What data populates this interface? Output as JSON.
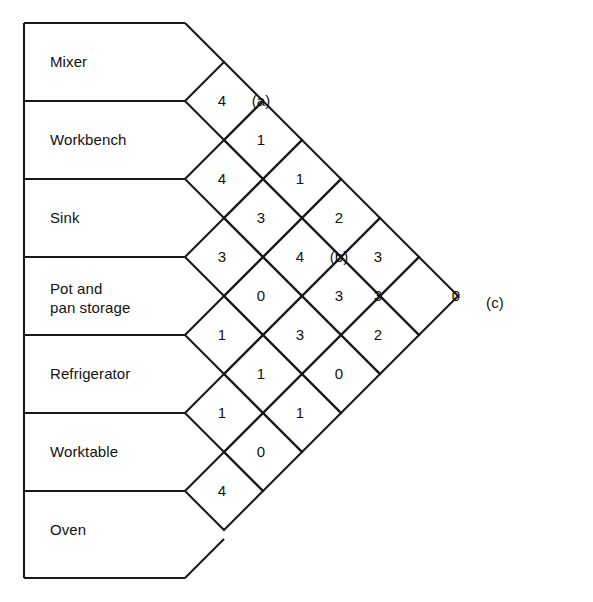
{
  "figure": {
    "kind": "activity-relationship-chart",
    "title": "",
    "stroke_color": "#1a1a1a",
    "text_color": "#121212",
    "background": "#ffffff"
  },
  "activities": [
    {
      "index": 1,
      "label": "Mixer"
    },
    {
      "index": 2,
      "label": "Workbench"
    },
    {
      "index": 3,
      "label": "Sink"
    },
    {
      "index": 4,
      "label": "Pot and\npan storage"
    },
    {
      "index": 5,
      "label": "Refrigerator"
    },
    {
      "index": 6,
      "label": "Worktable"
    },
    {
      "index": 7,
      "label": "Oven"
    }
  ],
  "chart_data": {
    "type": "table",
    "xlabel": "",
    "ylabel": "",
    "note": "Triangular REL chart: each diamond holds the closeness/flow rating between the pair of activities whose rows meet at that diamond. Letters (a), (b), (c) mark callout cells.",
    "row_labels": [
      "Mixer",
      "Workbench",
      "Sink",
      "Pot and pan storage",
      "Refrigerator",
      "Worktable",
      "Oven"
    ],
    "diagonals": [
      {
        "offset": 1,
        "pairs": [
          [
            "Mixer",
            "Workbench"
          ],
          [
            "Workbench",
            "Sink"
          ],
          [
            "Sink",
            "Pot and pan storage"
          ],
          [
            "Pot and pan storage",
            "Refrigerator"
          ],
          [
            "Refrigerator",
            "Worktable"
          ],
          [
            "Worktable",
            "Oven"
          ]
        ],
        "values": [
          "4",
          "4",
          "3",
          "1",
          "1",
          "4"
        ]
      },
      {
        "offset": 2,
        "pairs": [
          [
            "Mixer",
            "Sink"
          ],
          [
            "Workbench",
            "Pot and pan storage"
          ],
          [
            "Sink",
            "Refrigerator"
          ],
          [
            "Pot and pan storage",
            "Worktable"
          ],
          [
            "Refrigerator",
            "Oven"
          ]
        ],
        "values": [
          "(a)",
          "1",
          "3",
          "0",
          "1",
          "0"
        ]
      },
      {
        "offset": 3,
        "pairs": [
          [
            "Mixer",
            "Pot and pan storage"
          ],
          [
            "Workbench",
            "Refrigerator"
          ],
          [
            "Sink",
            "Worktable"
          ],
          [
            "Pot and pan storage",
            "Oven"
          ]
        ],
        "values": [
          "1",
          "4",
          "3",
          "1"
        ]
      },
      {
        "offset": 4,
        "pairs": [
          [
            "Mixer",
            "Refrigerator"
          ],
          [
            "Workbench",
            "Worktable"
          ],
          [
            "Sink",
            "Oven"
          ]
        ],
        "values": [
          "2",
          "(b)",
          "3",
          "0"
        ]
      },
      {
        "offset": 5,
        "pairs": [
          [
            "Mixer",
            "Worktable"
          ],
          [
            "Workbench",
            "Oven"
          ]
        ],
        "values": [
          "3",
          "3",
          "2"
        ]
      },
      {
        "offset": 6,
        "pairs": [
          [
            "Mixer",
            "Oven"
          ]
        ],
        "values": [
          "0",
          "(c)"
        ]
      }
    ],
    "cells": [
      {
        "col": 1,
        "row": 1,
        "cx": 222,
        "cy": 100,
        "value": "4"
      },
      {
        "col": 1,
        "row": 2,
        "cx": 222,
        "cy": 178,
        "value": "4"
      },
      {
        "col": 1,
        "row": 3,
        "cx": 222,
        "cy": 256,
        "value": "3"
      },
      {
        "col": 1,
        "row": 4,
        "cx": 222,
        "cy": 334,
        "value": "1"
      },
      {
        "col": 1,
        "row": 5,
        "cx": 222,
        "cy": 412,
        "value": "1"
      },
      {
        "col": 1,
        "row": 6,
        "cx": 222,
        "cy": 490,
        "value": "4"
      },
      {
        "col": 2,
        "row": 1,
        "cx": 261,
        "cy": 100,
        "value": "(a)"
      },
      {
        "col": 2,
        "row": 2,
        "cx": 261,
        "cy": 139,
        "value": "1"
      },
      {
        "col": 2,
        "row": 3,
        "cx": 261,
        "cy": 217,
        "value": "3"
      },
      {
        "col": 2,
        "row": 4,
        "cx": 261,
        "cy": 295,
        "value": "0"
      },
      {
        "col": 2,
        "row": 5,
        "cx": 261,
        "cy": 373,
        "value": "1"
      },
      {
        "col": 2,
        "row": 6,
        "cx": 261,
        "cy": 451,
        "value": "0"
      },
      {
        "col": 3,
        "row": 1,
        "cx": 300,
        "cy": 178,
        "value": "1"
      },
      {
        "col": 3,
        "row": 2,
        "cx": 300,
        "cy": 256,
        "value": "4"
      },
      {
        "col": 3,
        "row": 3,
        "cx": 300,
        "cy": 334,
        "value": "3"
      },
      {
        "col": 3,
        "row": 4,
        "cx": 300,
        "cy": 412,
        "value": "1"
      },
      {
        "col": 4,
        "row": 1,
        "cx": 339,
        "cy": 217,
        "value": "2"
      },
      {
        "col": 4,
        "row": 2,
        "cx": 339,
        "cy": 256,
        "value": "(b)"
      },
      {
        "col": 4,
        "row": 3,
        "cx": 339,
        "cy": 295,
        "value": "3"
      },
      {
        "col": 4,
        "row": 4,
        "cx": 339,
        "cy": 373,
        "value": "0"
      },
      {
        "col": 5,
        "row": 1,
        "cx": 378,
        "cy": 256,
        "value": "3"
      },
      {
        "col": 5,
        "row": 2,
        "cx": 378,
        "cy": 295,
        "value": "3"
      },
      {
        "col": 5,
        "row": 3,
        "cx": 378,
        "cy": 334,
        "value": "2"
      },
      {
        "col": 6,
        "row": 1,
        "cx": 456,
        "cy": 295,
        "value": "0"
      },
      {
        "col": 6,
        "row": 2,
        "cx": 495,
        "cy": 302,
        "value": "(c)"
      }
    ]
  },
  "callouts": [
    {
      "id": "a",
      "label": "(a)"
    },
    {
      "id": "b",
      "label": "(b)"
    },
    {
      "id": "c",
      "label": "(c)"
    }
  ]
}
